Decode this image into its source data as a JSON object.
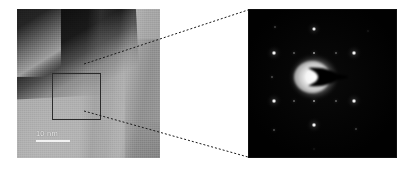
{
  "figure": {
    "background_color": "#ffffff",
    "width": 405,
    "height": 169
  },
  "tem_panel": {
    "name": "tem-micrograph",
    "caption": "Bright-field TEM micrograph of a thin lamella edge",
    "scale_bar": {
      "label": "10 nm",
      "bar_length_px": 34,
      "color": "#f2f2f2"
    },
    "selected_area_box": {
      "label": "selected area aperture region",
      "stroke_color": "#2b2b2b",
      "x": 35,
      "y": 64,
      "width": 49,
      "height": 47
    },
    "features": [
      "dark vacuum / thick-edge wedge across the upper-left corner",
      "uniform light-grey crystalline lamella filling the rest of the frame",
      "faint vertical contrast bands from bend contours"
    ],
    "colors": {
      "matrix_grey": "#aaaaaa",
      "dark_edge": "#101010"
    }
  },
  "connectors": {
    "name": "magnification-callout",
    "style": "dashed",
    "color": "#1a1a1a",
    "dash_pattern": "2 2",
    "lines": [
      {
        "label": "upper-callout",
        "x1": 84,
        "y1": 64,
        "x2": 248,
        "y2": 10
      },
      {
        "label": "lower-callout",
        "x1": 84,
        "y1": 111,
        "x2": 248,
        "y2": 157
      }
    ]
  },
  "diffraction_panel": {
    "name": "electron-diffraction-pattern",
    "caption": "Selected-area electron diffraction (SAED) pattern",
    "background_color": "#010101",
    "center": {
      "x": 66,
      "y": 68
    },
    "central_halo": {
      "label": "transmitted beam halo",
      "radius_px": 26,
      "color": "#f8f8f8"
    },
    "beam_stopper": {
      "label": "beam stopper shadow",
      "shape": "crescent",
      "color": "#020202"
    },
    "spots": [
      {
        "label": "spot-0-2",
        "x": 66,
        "y": 20,
        "r": 2.6,
        "intensity": 0.95
      },
      {
        "label": "spot--1-1",
        "x": 26,
        "y": 44,
        "r": 2.8,
        "intensity": 1.0
      },
      {
        "label": "spot-1-1",
        "x": 106,
        "y": 44,
        "r": 2.8,
        "intensity": 1.0
      },
      {
        "label": "spot--1--1",
        "x": 26,
        "y": 92,
        "r": 2.8,
        "intensity": 1.0
      },
      {
        "label": "spot-1--1",
        "x": 106,
        "y": 92,
        "r": 2.8,
        "intensity": 1.0
      },
      {
        "label": "spot-0--2",
        "x": 66,
        "y": 116,
        "r": 2.8,
        "intensity": 1.0
      },
      {
        "label": "spot-0-1-weak",
        "x": 66,
        "y": 44,
        "r": 1.7,
        "intensity": 0.5
      },
      {
        "label": "spot-0--1-weak",
        "x": 66,
        "y": 92,
        "r": 1.7,
        "intensity": 0.5
      },
      {
        "label": "spot--05-1-weak",
        "x": 46,
        "y": 44,
        "r": 1.4,
        "intensity": 0.38
      },
      {
        "label": "spot-05-1-weak",
        "x": 88,
        "y": 44,
        "r": 1.4,
        "intensity": 0.38
      },
      {
        "label": "spot--05--1-weak",
        "x": 46,
        "y": 92,
        "r": 1.4,
        "intensity": 0.4
      },
      {
        "label": "spot-05--1-weak",
        "x": 88,
        "y": 92,
        "r": 1.4,
        "intensity": 0.4
      },
      {
        "label": "spot--1-0-weak",
        "x": 24,
        "y": 68,
        "r": 1.3,
        "intensity": 0.35
      },
      {
        "label": "spot-outer-top-left",
        "x": 27,
        "y": 18,
        "r": 1.3,
        "intensity": 0.3
      },
      {
        "label": "spot-outer-top-right",
        "x": 120,
        "y": 22,
        "r": 1.0,
        "intensity": 0.22
      },
      {
        "label": "spot-outer-bottom-left",
        "x": 26,
        "y": 121,
        "r": 1.4,
        "intensity": 0.33
      },
      {
        "label": "spot-outer-bottom-right",
        "x": 108,
        "y": 120,
        "r": 1.3,
        "intensity": 0.3
      },
      {
        "label": "spot-far-bottom",
        "x": 66,
        "y": 140,
        "r": 1.0,
        "intensity": 0.2
      }
    ],
    "symmetry": "hexagonal / pseudo-sixfold single-crystal spot array"
  }
}
